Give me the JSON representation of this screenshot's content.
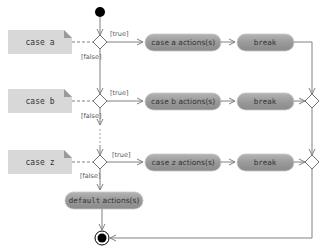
{
  "diagram": {
    "type": "uml-activity",
    "colors": {
      "pill_fill": "#9c9c9c",
      "note_fill": "#d8d8d8",
      "line": "#808080",
      "node": "#000000"
    },
    "cases": [
      {
        "note": "case a",
        "action": "case a actions(s)",
        "action_keyword": "case",
        "action_rest": " a actions(s)",
        "break_label": "break",
        "true_guard": "[true]",
        "false_guard": "[false]"
      },
      {
        "note": "case b",
        "action": "case b actions(s)",
        "action_keyword": "case",
        "action_rest": " b actions(s)",
        "break_label": "break",
        "true_guard": "[true]",
        "false_guard": "[false]"
      },
      {
        "note": "case z",
        "action": "case z actions(s)",
        "action_keyword": "case",
        "action_rest": " z actions(s)",
        "break_label": "break",
        "true_guard": "[true]",
        "false_guard": "[false]"
      }
    ],
    "default": {
      "keyword": "default",
      "rest": " actions(s)"
    },
    "nodes": {
      "initial": "initial-state",
      "final": "final-state",
      "ellipsis": "..."
    }
  }
}
